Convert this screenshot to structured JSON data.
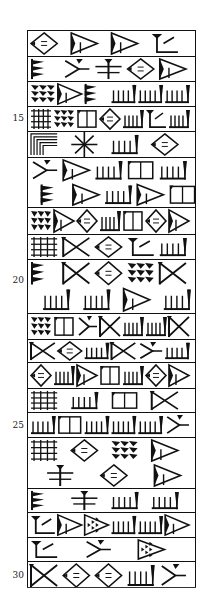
{
  "document": {
    "type": "cuneiform-facsimile",
    "line_numbers": [
      {
        "label": "15",
        "line": 15
      },
      {
        "label": "20",
        "line": 20
      },
      {
        "label": "25",
        "line": 25
      },
      {
        "label": "30",
        "line": 30
      }
    ],
    "rows": [
      {
        "line": 12,
        "signs": [
          "diamond",
          "wedge-large",
          "wedge-large",
          "angle-sign"
        ]
      },
      {
        "line": 13,
        "signs": [
          "triple-wedge",
          "hook",
          "cross-sign",
          "diamond",
          "wedge-large"
        ]
      },
      {
        "line": 14,
        "signs": [
          "stacked-wedges",
          "wedge-large",
          "triple-wedge",
          "comb",
          "comb",
          "comb"
        ]
      },
      {
        "line": 15,
        "signs": [
          "grid-sign",
          "stacked-wedges",
          "box",
          "diamond",
          "comb",
          "angle-sign",
          "comb"
        ]
      },
      {
        "line": 16,
        "signs": [
          "nested-corner",
          "star-sign",
          "comb",
          "diamond"
        ]
      },
      {
        "line": 17,
        "signs": [
          "hook",
          "wedge-large",
          "comb",
          "box",
          "comb",
          "triple-wedge",
          "wedge-large",
          "comb",
          "wedge-large",
          "box"
        ]
      },
      {
        "line": 18,
        "signs": [
          "stacked-wedges",
          "wedge-large",
          "diamond",
          "comb",
          "box",
          "diamond",
          "wedge-large"
        ]
      },
      {
        "line": 19,
        "signs": [
          "grid-sign",
          "bow-tie",
          "diamond",
          "angle-sign",
          "comb"
        ]
      },
      {
        "line": 20,
        "signs": [
          "triple-wedge",
          "bow-tie",
          "diamond",
          "stacked-wedges",
          "bow-tie",
          "comb",
          "comb",
          "wedge-large",
          "comb"
        ]
      },
      {
        "line": 21,
        "signs": [
          "stacked-wedges",
          "box",
          "hook",
          "bow-tie",
          "comb",
          "comb",
          "bow-tie"
        ]
      },
      {
        "line": 22,
        "signs": [
          "bow-tie",
          "diamond",
          "comb",
          "bow-tie",
          "hook",
          "comb"
        ]
      },
      {
        "line": 23,
        "signs": [
          "diamond",
          "comb",
          "wedge-large",
          "box",
          "comb",
          "diamond",
          "wedge-large"
        ]
      },
      {
        "line": 24,
        "signs": [
          "grid-sign",
          "comb",
          "box",
          "bow-tie"
        ]
      },
      {
        "line": 25,
        "signs": [
          "comb",
          "box",
          "comb",
          "comb",
          "comb",
          "hook"
        ]
      },
      {
        "line": 26,
        "signs": [
          "grid-sign",
          "diamond",
          "stacked-wedges",
          "wedge-large",
          "cross-sign",
          "diamond",
          "wedge-large"
        ]
      },
      {
        "line": 27,
        "signs": [
          "triple-wedge",
          "cross-sign",
          "comb",
          "comb"
        ]
      },
      {
        "line": 28,
        "signs": [
          "angle-sign",
          "wedge-large",
          "triangle-dots",
          "comb",
          "comb",
          "wedge-large"
        ]
      },
      {
        "line": 29,
        "signs": [
          "angle-sign",
          "hook",
          "triangle-dots"
        ]
      },
      {
        "line": 30,
        "signs": [
          "bow-tie",
          "diamond",
          "diamond",
          "comb",
          "hook"
        ]
      }
    ]
  }
}
